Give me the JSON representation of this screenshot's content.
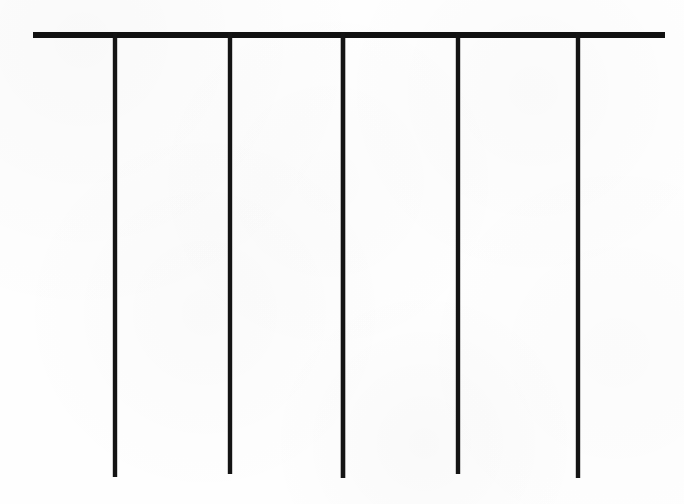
{
  "figure": {
    "width": 684,
    "height": 504,
    "background_color": "#fefefe",
    "ink_color": "#111111"
  },
  "chart_data": {
    "type": "diagram",
    "title": "",
    "subtitle": "",
    "xlabel": "",
    "ylabel": "",
    "grid": false,
    "legend": null,
    "annotations": [],
    "axis_ranges": {
      "x": [
        0,
        684
      ],
      "y": [
        0,
        504
      ]
    },
    "elements": [
      {
        "name": "horizontal-bar",
        "kind": "line",
        "x1": 33,
        "y1": 35,
        "x2": 665,
        "y2": 35,
        "stroke_width": 6,
        "color": "#111111",
        "length": 632
      },
      {
        "name": "vertical-tine-1",
        "kind": "line",
        "x1": 115,
        "y1": 36,
        "x2": 115,
        "y2": 477,
        "stroke_width": 4.4,
        "color": "#141414",
        "length": 441
      },
      {
        "name": "vertical-tine-2",
        "kind": "line",
        "x1": 230,
        "y1": 36,
        "x2": 230,
        "y2": 474,
        "stroke_width": 4.4,
        "color": "#141414",
        "length": 438
      },
      {
        "name": "vertical-tine-3",
        "kind": "line",
        "x1": 343,
        "y1": 36,
        "x2": 343,
        "y2": 478,
        "stroke_width": 4.6,
        "color": "#141414",
        "length": 442
      },
      {
        "name": "vertical-tine-4",
        "kind": "line",
        "x1": 458,
        "y1": 36,
        "x2": 458,
        "y2": 474,
        "stroke_width": 4.4,
        "color": "#141414",
        "length": 438
      },
      {
        "name": "vertical-tine-5",
        "kind": "line",
        "x1": 578,
        "y1": 36,
        "x2": 578,
        "y2": 478,
        "stroke_width": 4.4,
        "color": "#141414",
        "length": 442
      }
    ],
    "tine_count": 5,
    "tine_x_positions": [
      115,
      230,
      343,
      458,
      578
    ],
    "tine_spacings": [
      115,
      113,
      115,
      120
    ],
    "bar_overhang_left": 82,
    "bar_overhang_right": 87
  }
}
